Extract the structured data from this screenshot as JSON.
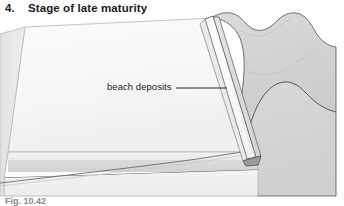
{
  "heading": {
    "number": "4.",
    "title": "Stage of late maturity"
  },
  "callouts": {
    "beach_deposits": "beach deposits"
  },
  "caption": {
    "text": "Fig. 10.42"
  },
  "colors": {
    "background": "#ffffff",
    "platform_top": "#f7f7f7",
    "platform_front_upper": "#eeeeee",
    "platform_front_band": "#d9d9d9",
    "platform_front_lower": "#f2f2f2",
    "platform_left_face": "#e4e4e4",
    "hills_fill": "#d4d4d4",
    "hills_shade": "#c6c6c6",
    "ridge_fill": "#fbfbfb",
    "ridge_shadow": "#bdbdbd",
    "outline": "#4a4a4a",
    "outline_soft": "#8c8c8c",
    "text": "#1b1b1b",
    "leader_line": "#2a2a2a"
  },
  "diagram": {
    "type": "block-diagram",
    "elements": [
      "wave-cut platform",
      "beach deposit ridge",
      "scalloped hill coastline",
      "sea level bench"
    ]
  }
}
